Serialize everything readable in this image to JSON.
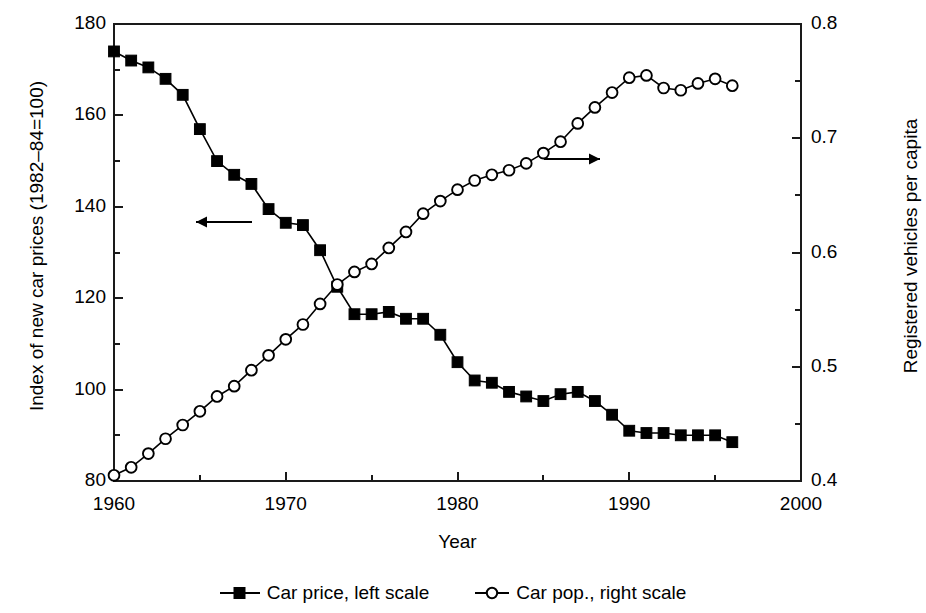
{
  "chart_data": {
    "type": "line",
    "title": "",
    "xlabel": "Year",
    "ylabel": "Index of new car prices (1982–84=100)",
    "ylabel_right": "Registered vehicles per capita",
    "xlim": [
      1960,
      2000
    ],
    "ylim": [
      80,
      180
    ],
    "ylim_right": [
      0.4,
      0.8
    ],
    "xticks": [
      1960,
      1970,
      1980,
      1990,
      2000
    ],
    "xtick_labels": [
      "1960",
      "1970",
      "1980",
      "1990",
      "2000"
    ],
    "xminor_ticks": [
      1965,
      1975,
      1985,
      1995
    ],
    "yticks": [
      80,
      100,
      120,
      140,
      160,
      180
    ],
    "ytick_labels": [
      "80",
      "100",
      "120",
      "140",
      "160",
      "180"
    ],
    "yminor_ticks": [
      90,
      110,
      130,
      150,
      170
    ],
    "yticks_right": [
      0.4,
      0.5,
      0.6,
      0.7,
      0.8
    ],
    "ytick_labels_right": [
      "0.4",
      "0.5",
      "0.6",
      "0.7",
      "0.8"
    ],
    "yminor_ticks_right": [
      0.45,
      0.55,
      0.65,
      0.75
    ],
    "grid": false,
    "legend_position": "below",
    "x": [
      1960,
      1961,
      1962,
      1963,
      1964,
      1965,
      1966,
      1967,
      1968,
      1969,
      1970,
      1971,
      1972,
      1973,
      1974,
      1975,
      1976,
      1977,
      1978,
      1979,
      1980,
      1981,
      1982,
      1983,
      1984,
      1985,
      1986,
      1987,
      1988,
      1989,
      1990,
      1991,
      1992,
      1993,
      1994,
      1995,
      1996
    ],
    "series": [
      {
        "name": "Car price, left scale",
        "axis": "left",
        "marker": "filled-square",
        "color": "#000000",
        "values": [
          174.0,
          172.0,
          170.5,
          168.0,
          164.5,
          157.0,
          150.0,
          147.0,
          145.0,
          139.5,
          136.5,
          136.0,
          130.5,
          122.5,
          116.5,
          116.5,
          117.0,
          115.5,
          115.5,
          112.0,
          106.0,
          102.0,
          101.5,
          99.5,
          98.5,
          97.5,
          99.0,
          99.5,
          97.5,
          94.5,
          91.0,
          90.5,
          90.5,
          90.0,
          90.0,
          90.0,
          88.5
        ]
      },
      {
        "name": "Car pop., right scale",
        "axis": "right",
        "marker": "open-circle",
        "color": "#000000",
        "values": [
          0.405,
          0.412,
          0.424,
          0.437,
          0.449,
          0.461,
          0.474,
          0.483,
          0.497,
          0.51,
          0.524,
          0.537,
          0.555,
          0.572,
          0.583,
          0.59,
          0.604,
          0.618,
          0.634,
          0.645,
          0.655,
          0.663,
          0.668,
          0.672,
          0.678,
          0.687,
          0.697,
          0.713,
          0.727,
          0.74,
          0.753,
          0.755,
          0.744,
          0.742,
          0.748,
          0.752,
          0.746
        ]
      }
    ],
    "annotations": [
      {
        "name": "left-scale-arrow",
        "direction": "left",
        "x_px": 196,
        "y_px": 222,
        "length_px": 56
      },
      {
        "name": "right-scale-arrow",
        "direction": "right",
        "x_px": 544,
        "y_px": 159,
        "length_px": 56
      }
    ]
  },
  "legend": {
    "items": [
      {
        "label": "Car price, left scale",
        "marker": "filled-square"
      },
      {
        "label": "Car pop., right scale",
        "marker": "open-circle"
      }
    ]
  }
}
